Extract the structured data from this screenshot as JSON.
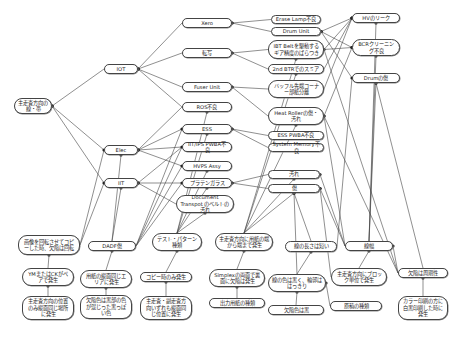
{
  "diagram": {
    "type": "cause-effect network",
    "nodes": [
      {
        "id": "n_main",
        "label": "主走査方向の線・帯",
        "x": 14,
        "y": 98,
        "w": 38,
        "h": 16
      },
      {
        "id": "n_iot",
        "label": "IOT",
        "x": 104,
        "y": 64,
        "w": 34,
        "h": 10
      },
      {
        "id": "n_elec",
        "label": "Elec",
        "x": 104,
        "y": 145,
        "w": 34,
        "h": 10
      },
      {
        "id": "n_iit",
        "label": "IIT",
        "x": 104,
        "y": 178,
        "w": 34,
        "h": 10
      },
      {
        "id": "n_xero",
        "label": "Xero",
        "x": 182,
        "y": 18,
        "w": 50,
        "h": 10
      },
      {
        "id": "n_tensha",
        "label": "転写",
        "x": 182,
        "y": 48,
        "w": 50,
        "h": 10
      },
      {
        "id": "n_fuser",
        "label": "Fuser Unit",
        "x": 182,
        "y": 82,
        "w": 50,
        "h": 10
      },
      {
        "id": "n_ros",
        "label": "ROS不良",
        "x": 182,
        "y": 102,
        "w": 50,
        "h": 10
      },
      {
        "id": "n_ess",
        "label": "ESS",
        "x": 182,
        "y": 124,
        "w": 50,
        "h": 10
      },
      {
        "id": "n_iitips",
        "label": "IIT/IPS PWBA不良",
        "x": 182,
        "y": 142,
        "w": 50,
        "h": 10
      },
      {
        "id": "n_hvps",
        "label": "HVPS Assy",
        "x": 182,
        "y": 161,
        "w": 50,
        "h": 10
      },
      {
        "id": "n_platen",
        "label": "プラテンガラス",
        "x": 182,
        "y": 178,
        "w": 50,
        "h": 10
      },
      {
        "id": "n_doc",
        "label": "Document Transpot のベルトの汚れ",
        "x": 176,
        "y": 195,
        "w": 58,
        "h": 18
      },
      {
        "id": "n_erase",
        "label": "Erase Lamp不良",
        "x": 271,
        "y": 15,
        "w": 50,
        "h": 9
      },
      {
        "id": "n_drum",
        "label": "Drum Unit",
        "x": 271,
        "y": 27,
        "w": 50,
        "h": 9
      },
      {
        "id": "n_ibt",
        "label": "IBT Beltを駆動するギア精度のばらつき",
        "x": 268,
        "y": 40,
        "w": 56,
        "h": 19
      },
      {
        "id": "n_2nd",
        "label": "2nd BTRでのスミア",
        "x": 268,
        "y": 64,
        "w": 56,
        "h": 10
      },
      {
        "id": "n_bafuru",
        "label": "バッフル先端コーナー部紙分離",
        "x": 268,
        "y": 80,
        "w": 56,
        "h": 18
      },
      {
        "id": "n_heat",
        "label": "Heat Rollerの傷・汚れ",
        "x": 268,
        "y": 107,
        "w": 56,
        "h": 18
      },
      {
        "id": "n_esspwba",
        "label": "ESS PWBA不良",
        "x": 268,
        "y": 131,
        "w": 56,
        "h": 9
      },
      {
        "id": "n_sysmem",
        "label": "System Memory不良",
        "x": 268,
        "y": 143,
        "w": 56,
        "h": 9
      },
      {
        "id": "n_yogore",
        "label": "汚れ",
        "x": 268,
        "y": 170,
        "w": 52,
        "h": 9
      },
      {
        "id": "n_kizu",
        "label": "傷",
        "x": 268,
        "y": 184,
        "w": 52,
        "h": 9
      },
      {
        "id": "n_hv",
        "label": "HVのリーク",
        "x": 352,
        "y": 13,
        "w": 48,
        "h": 10
      },
      {
        "id": "n_bcr",
        "label": "BCRクリーニング不良",
        "x": 352,
        "y": 39,
        "w": 48,
        "h": 17
      },
      {
        "id": "n_drumkizu",
        "label": "Drumの傷",
        "x": 352,
        "y": 73,
        "w": 48,
        "h": 10
      },
      {
        "id": "n_r1",
        "label": "画像を回転させてコピーした時、欠陥は回転",
        "x": 18,
        "y": 235,
        "w": 62,
        "h": 20
      },
      {
        "id": "n_dadf",
        "label": "DADF傷",
        "x": 88,
        "y": 241,
        "w": 48,
        "h": 10
      },
      {
        "id": "n_test",
        "label": "テスト・パターン種類",
        "x": 152,
        "y": 233,
        "w": 50,
        "h": 18
      },
      {
        "id": "n_sub",
        "label": "主走査方向に用紙の端から端まで発生",
        "x": 215,
        "y": 233,
        "w": 58,
        "h": 18
      },
      {
        "id": "n_len",
        "label": "線の長さは短い",
        "x": 285,
        "y": 241,
        "w": 52,
        "h": 11
      },
      {
        "id": "n_sen",
        "label": "線幅",
        "x": 345,
        "y": 241,
        "w": 48,
        "h": 10
      },
      {
        "id": "n_ymc",
        "label": "YMまたはCKがペアで発生",
        "x": 22,
        "y": 268,
        "w": 52,
        "h": 18
      },
      {
        "id": "n_paper",
        "label": "用紙の縦面同じエリアに発生",
        "x": 80,
        "y": 270,
        "w": 52,
        "h": 18
      },
      {
        "id": "n_copy",
        "label": "コピー時のみ発生",
        "x": 140,
        "y": 272,
        "w": 52,
        "h": 10
      },
      {
        "id": "n_simplex",
        "label": "Simplexの両面で裏面に欠陥は発生",
        "x": 209,
        "y": 269,
        "w": 56,
        "h": 18
      },
      {
        "id": "n_color",
        "label": "線の色は黒く、輪郭ははっきり",
        "x": 268,
        "y": 274,
        "w": 58,
        "h": 18
      },
      {
        "id": "n_block",
        "label": "主走査方向にブロック単位で発生",
        "x": 331,
        "y": 268,
        "w": 56,
        "h": 18
      },
      {
        "id": "n_kekkan",
        "label": "欠陥は周期性",
        "x": 398,
        "y": 268,
        "w": 50,
        "h": 10
      },
      {
        "id": "n_only",
        "label": "主走査方向の位置のみ縦面同じ場所に発生",
        "x": 22,
        "y": 296,
        "w": 52,
        "h": 24
      },
      {
        "id": "n_kakeiro",
        "label": "欠陥色は黒部の色が混じった黒っぽい色",
        "x": 80,
        "y": 295,
        "w": 52,
        "h": 24
      },
      {
        "id": "n_both",
        "label": "主走査・副走査方向いずれも縦面同じ位置に発生",
        "x": 140,
        "y": 296,
        "w": 52,
        "h": 24
      },
      {
        "id": "n_output",
        "label": "出力用紙の種類",
        "x": 209,
        "y": 298,
        "w": 56,
        "h": 10
      },
      {
        "id": "n_kbk",
        "label": "欠陥色は黒",
        "x": 268,
        "y": 305,
        "w": 56,
        "h": 10
      },
      {
        "id": "n_gen",
        "label": "原稿の種類",
        "x": 330,
        "y": 301,
        "w": 52,
        "h": 10
      },
      {
        "id": "n_color_l",
        "label": "カラー印刷の方に白黒印刷した時に発生",
        "x": 398,
        "y": 296,
        "w": 50,
        "h": 24
      }
    ],
    "edges": [
      [
        "n_iot",
        "n_main"
      ],
      [
        "n_elec",
        "n_main"
      ],
      [
        "n_iit",
        "n_main"
      ],
      [
        "n_xero",
        "n_iot"
      ],
      [
        "n_tensha",
        "n_iot"
      ],
      [
        "n_fuser",
        "n_iot"
      ],
      [
        "n_ros",
        "n_iot"
      ],
      [
        "n_ess",
        "n_elec"
      ],
      [
        "n_iitips",
        "n_elec"
      ],
      [
        "n_hvps",
        "n_elec"
      ],
      [
        "n_ros",
        "n_elec"
      ],
      [
        "n_platen",
        "n_iit"
      ],
      [
        "n_doc",
        "n_iit"
      ],
      [
        "n_iitips",
        "n_iit"
      ],
      [
        "n_erase",
        "n_xero"
      ],
      [
        "n_drum",
        "n_xero"
      ],
      [
        "n_ibt",
        "n_tensha"
      ],
      [
        "n_2nd",
        "n_tensha"
      ],
      [
        "n_bafuru",
        "n_fuser"
      ],
      [
        "n_heat",
        "n_fuser"
      ],
      [
        "n_esspwba",
        "n_ess"
      ],
      [
        "n_sysmem",
        "n_ess"
      ],
      [
        "n_hv",
        "n_drum"
      ],
      [
        "n_bcr",
        "n_drum"
      ],
      [
        "n_drumkizu",
        "n_drum"
      ],
      [
        "n_yogore",
        "n_platen"
      ],
      [
        "n_kizu",
        "n_platen"
      ],
      [
        "n_r1",
        "n_iit"
      ],
      [
        "n_r1",
        "n_elec"
      ],
      [
        "n_ymc",
        "n_r1"
      ],
      [
        "n_only",
        "n_ymc"
      ],
      [
        "n_paper",
        "n_dadf"
      ],
      [
        "n_kakeiro",
        "n_paper"
      ],
      [
        "n_copy",
        "n_test"
      ],
      [
        "n_both",
        "n_copy"
      ],
      [
        "n_simplex",
        "n_sub"
      ],
      [
        "n_output",
        "n_simplex"
      ],
      [
        "n_color",
        "n_len"
      ],
      [
        "n_kbk",
        "n_color"
      ],
      [
        "n_gen",
        "n_color"
      ],
      [
        "n_block",
        "n_sen"
      ],
      [
        "n_kekkan",
        "n_sen"
      ],
      [
        "n_color_l",
        "n_kekkan"
      ],
      [
        "n_dadf",
        "n_iit"
      ],
      [
        "n_dadf",
        "n_elec"
      ],
      [
        "n_dadf",
        "n_iitips"
      ],
      [
        "n_dadf",
        "n_hvps"
      ],
      [
        "n_dadf",
        "n_platen"
      ],
      [
        "n_dadf",
        "n_ess"
      ],
      [
        "n_test",
        "n_ros"
      ],
      [
        "n_test",
        "n_ess"
      ],
      [
        "n_test",
        "n_hvps"
      ],
      [
        "n_test",
        "n_platen"
      ],
      [
        "n_test",
        "n_doc"
      ],
      [
        "n_sub",
        "n_heat"
      ],
      [
        "n_sub",
        "n_2nd"
      ],
      [
        "n_sub",
        "n_kizu"
      ],
      [
        "n_sub",
        "n_yogore"
      ],
      [
        "n_sub",
        "n_ibt"
      ],
      [
        "n_len",
        "n_kizu"
      ],
      [
        "n_len",
        "n_drumkizu"
      ],
      [
        "n_sen",
        "n_drumkizu"
      ],
      [
        "n_sen",
        "n_bcr"
      ],
      [
        "n_sen",
        "n_hv"
      ],
      [
        "n_sen",
        "n_kizu"
      ],
      [
        "n_sen",
        "n_yogore"
      ],
      [
        "n_sen",
        "n_heat"
      ],
      [
        "n_kekkan",
        "n_drumkizu"
      ],
      [
        "n_kekkan",
        "n_heat"
      ],
      [
        "n_kekkan",
        "n_ibt"
      ],
      [
        "n_color",
        "n_kizu"
      ],
      [
        "n_block",
        "n_kizu"
      ],
      [
        "n_ibt",
        "n_bcr"
      ],
      [
        "n_bafuru",
        "n_hv"
      ],
      [
        "n_2nd",
        "n_hv"
      ],
      [
        "n_heat",
        "n_bcr"
      ],
      [
        "n_ibt",
        "n_hv"
      ]
    ],
    "line_color": "#444444",
    "node_border_color": "#444444",
    "background": "#ffffff"
  }
}
